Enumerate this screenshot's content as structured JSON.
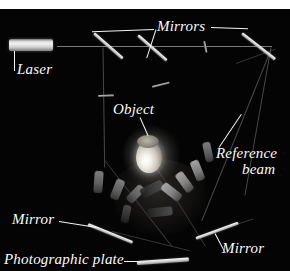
{
  "figure": {
    "background_color": "#040404",
    "top_margin_color": "#ffffff",
    "label_color": "#fdfdfd",
    "mirror_color": "#ffffff",
    "beam_color": "#8e8e8e"
  },
  "labels": {
    "mirrors_top": "Mirrors",
    "laser": "Laser",
    "object": "Object",
    "reference_beam_line1": "Reference",
    "reference_beam_line2": "beam",
    "mirror_bottom_left": "Mirror",
    "mirror_bottom_right": "Mirror",
    "photographic_plate": "Photographic plate"
  },
  "components": {
    "laser": "laser-tube",
    "object": "illuminated-object",
    "photographic_plate": "photographic-plate",
    "mirror_count": 6,
    "beam_count": 8
  }
}
